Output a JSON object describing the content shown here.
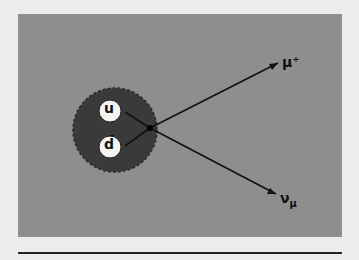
{
  "diagram": {
    "meson": {
      "quarks": [
        {
          "label": "u"
        },
        {
          "label": "d̄"
        }
      ],
      "fill": "#3a3a3a"
    },
    "outgoing": [
      {
        "label": "μ⁺"
      },
      {
        "label": "ν_μ",
        "base": "ν",
        "sub": "μ"
      }
    ],
    "colors": {
      "panel": "#8e8e8e",
      "background": "#ececec",
      "line": "#111111"
    }
  }
}
